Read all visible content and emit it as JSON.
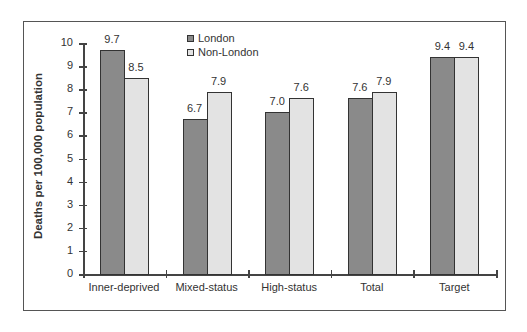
{
  "chart_data": {
    "type": "bar",
    "title": "",
    "xlabel": "",
    "ylabel": "Deaths per 100,000 population",
    "ylim": [
      0,
      10
    ],
    "yticks": [
      0,
      1,
      2,
      3,
      4,
      5,
      6,
      7,
      8,
      9,
      10
    ],
    "grid": false,
    "legend_position": "top-center (inside plot)",
    "categories": [
      "Inner-deprived",
      "Mixed-status",
      "High-status",
      "Total",
      "Target"
    ],
    "series": [
      {
        "name": "London",
        "color": "#8a8a8a",
        "values": [
          9.7,
          6.7,
          7.0,
          7.6,
          9.4
        ],
        "labels": [
          "9.7",
          "6.7",
          "7.0",
          "7.6",
          "9.4"
        ]
      },
      {
        "name": "Non-London",
        "color": "#e3e3e3",
        "values": [
          8.5,
          7.9,
          7.6,
          7.9,
          9.4
        ],
        "labels": [
          "8.5",
          "7.9",
          "7.6",
          "7.9",
          "9.4"
        ]
      }
    ]
  }
}
